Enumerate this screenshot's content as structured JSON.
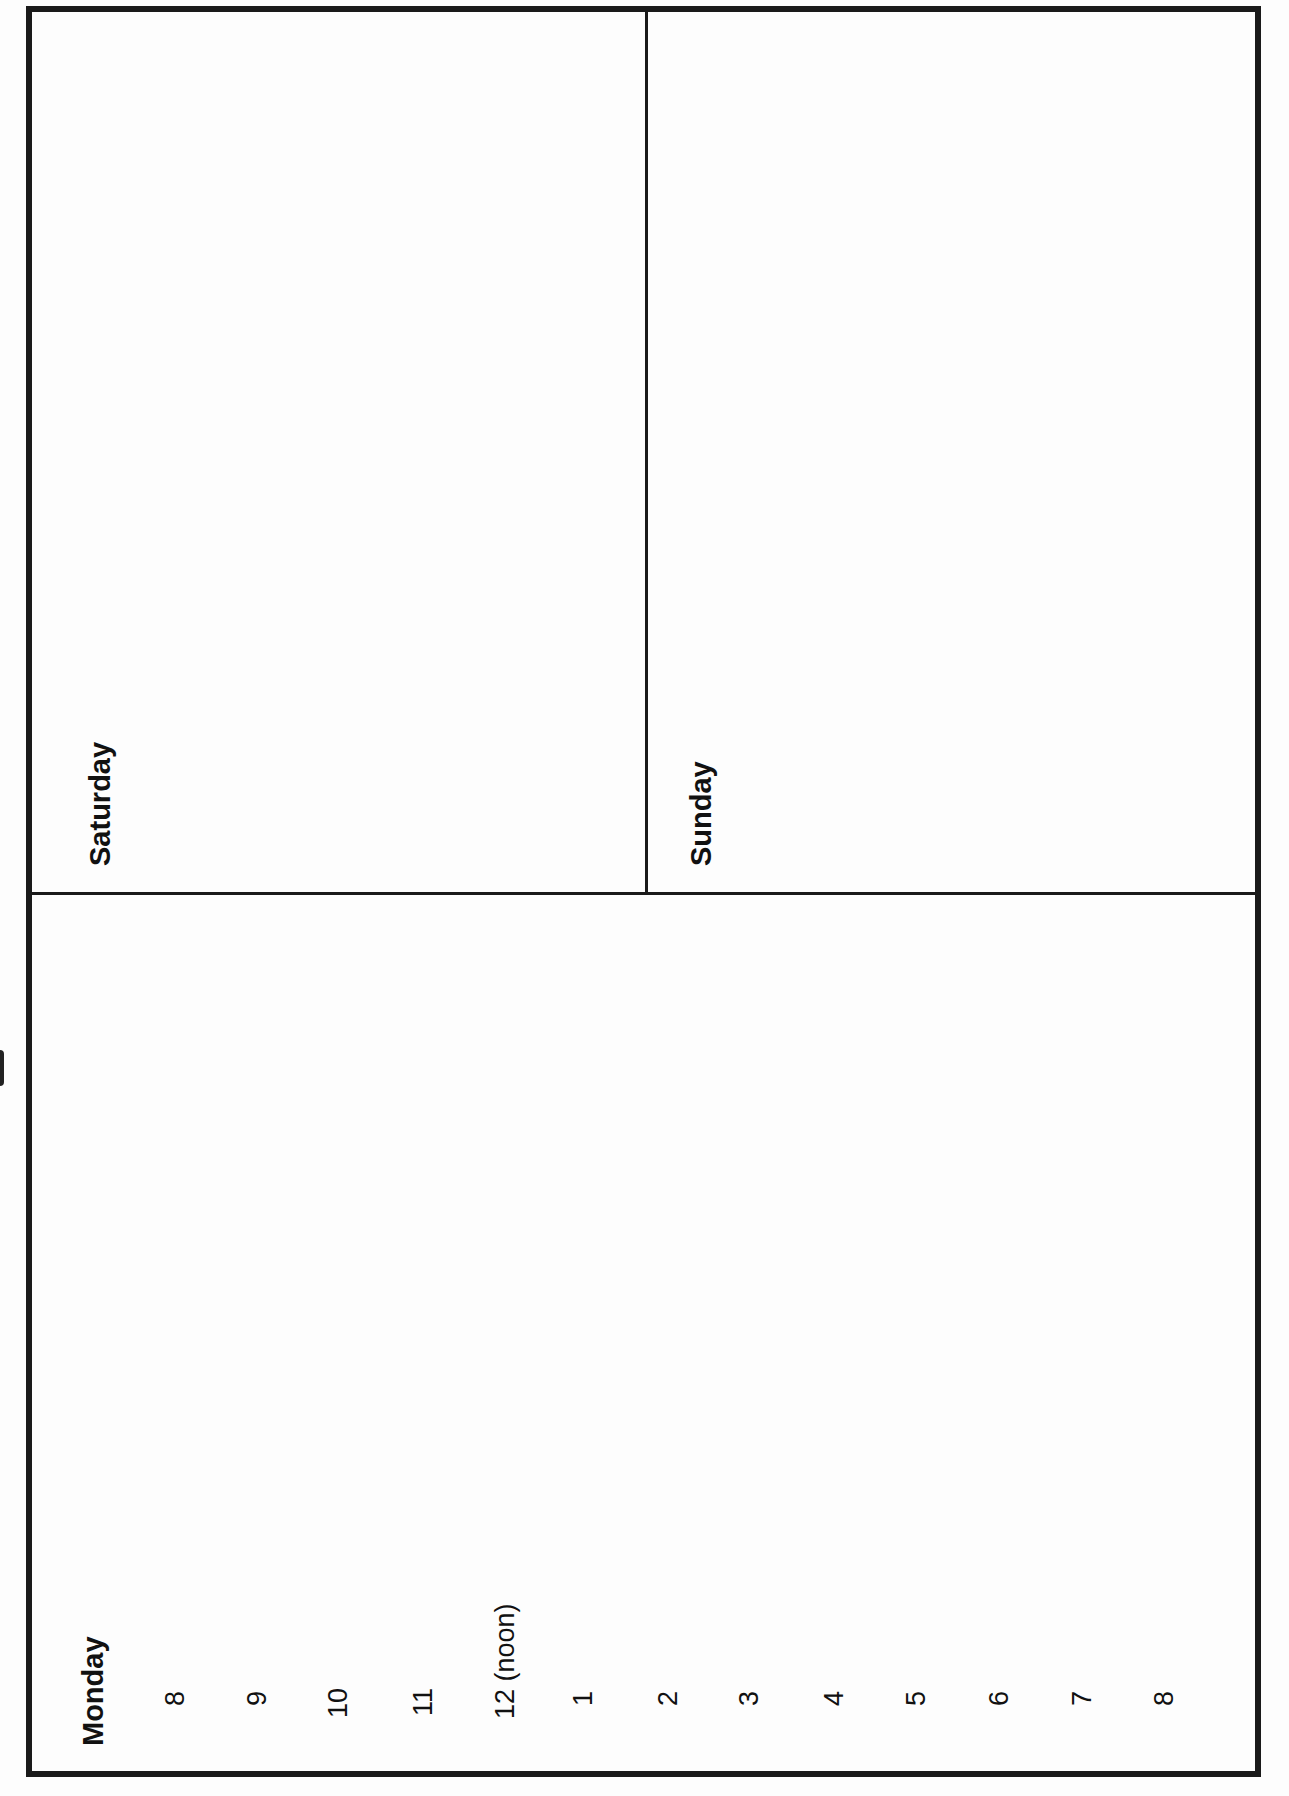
{
  "planner": {
    "days": {
      "saturday": "Saturday",
      "sunday": "Sunday",
      "monday": "Monday"
    },
    "hours": [
      "8",
      "9",
      "10",
      "11",
      "12 (noon)",
      "1",
      "2",
      "3",
      "4",
      "5",
      "6",
      "7",
      "8"
    ]
  }
}
